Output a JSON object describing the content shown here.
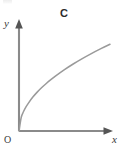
{
  "figure": {
    "background_color": "#ffffff",
    "axis_color": "#8a8a8a",
    "curve_color": "#9a9a9a",
    "label_color": "#3a3a3a",
    "curve_label_color": "#2b2b2b",
    "y_axis_label": "y",
    "x_axis_label": "x",
    "origin_label": "O",
    "curve_label": "C"
  },
  "chart_data": {
    "type": "line",
    "title": "",
    "subtitle": "",
    "xlabel": "x",
    "ylabel": "y",
    "origin_label": "O",
    "grid": false,
    "legend": null,
    "legend_position": "none",
    "xlim": [
      0,
      10
    ],
    "ylim": [
      0,
      10
    ],
    "axis_ticks": {
      "x": [],
      "y": []
    },
    "annotations": [
      {
        "text": "C",
        "x": 4.6,
        "y": 9.6,
        "role": "curve-name",
        "style": "bold"
      }
    ],
    "series": [
      {
        "name": "C",
        "description": "increasing concave curve through the origin (square-root / logarithmic shape)",
        "x": [
          0.0,
          0.25,
          0.5,
          0.75,
          1.0,
          1.5,
          2.0,
          2.5,
          3.0,
          3.5,
          4.0,
          5.0,
          6.0,
          7.0,
          8.0,
          9.0,
          10.0
        ],
        "y": [
          0.0,
          1.48,
          2.09,
          2.56,
          2.95,
          3.62,
          4.18,
          4.67,
          5.11,
          5.52,
          5.9,
          6.6,
          7.23,
          7.81,
          8.35,
          8.85,
          9.33
        ]
      }
    ]
  }
}
